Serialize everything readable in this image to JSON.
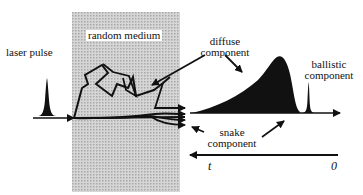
{
  "diagram": {
    "labels": {
      "laser_pulse": "laser pulse",
      "random_medium": "random medium",
      "diffuse_line1": "diffuse",
      "diffuse_line2": "component",
      "ballistic_line1": "ballistic",
      "ballistic_line2": "component",
      "snake_line1": "snake",
      "snake_line2": "component"
    },
    "time_axis": {
      "start_label": "t",
      "end_label": "0"
    },
    "colors": {
      "medium_fill": "#c8c8c8",
      "ink": "#111111",
      "background": "#ffffff"
    }
  }
}
